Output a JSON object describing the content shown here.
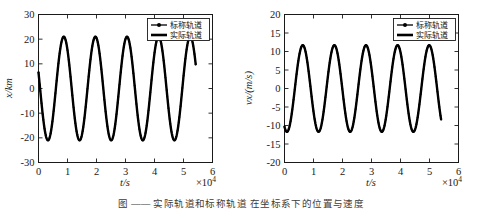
{
  "figure": {
    "caption": "图  ——  实际轨道和标称轨道    在坐标系下的位置与速度",
    "background_color": "#ffffff",
    "curve_color": "#000000",
    "axis_color": "#1a1a1a"
  },
  "legend": {
    "entries": [
      {
        "label": "标称轨道",
        "style": "line-with-circle-marker"
      },
      {
        "label": "实际轨道",
        "style": "solid-thick-line"
      }
    ]
  },
  "chart_data": [
    {
      "type": "line",
      "title": "",
      "xlabel": "t/s",
      "ylabel": "x/km",
      "x_exponent_label": "×10",
      "x_exponent_power": "4",
      "xlim": [
        0,
        6
      ],
      "ylim": [
        -30,
        30
      ],
      "xticks": [
        0,
        1,
        2,
        3,
        4,
        5,
        6
      ],
      "xtick_labels": [
        "0",
        "1",
        "2",
        "3",
        "4",
        "5",
        "6"
      ],
      "yticks": [
        -30,
        -20,
        -10,
        0,
        10,
        20,
        30
      ],
      "ytick_labels": [
        "-30",
        "-20",
        "-10",
        "0",
        "10",
        "20",
        "30"
      ],
      "grid": false,
      "legend_position": "upper-right",
      "series": [
        {
          "name": "标称轨道",
          "marker": "circle",
          "amplitude": 21.0,
          "period_x": 1.09,
          "phase_deg": 72,
          "x_start": 0,
          "x_end": 5.42,
          "x": [
            0.0,
            0.1,
            0.2,
            0.3,
            0.4,
            0.5,
            0.6,
            0.7,
            0.8,
            0.9,
            1.0,
            1.1,
            1.2,
            1.3,
            1.4,
            1.5,
            1.6,
            1.7,
            1.8,
            1.9,
            2.0,
            2.1,
            2.2,
            2.3,
            2.4,
            2.5,
            2.6,
            2.7,
            2.8,
            2.9,
            3.0,
            3.1,
            3.2,
            3.3,
            3.4,
            3.5,
            3.6,
            3.7,
            3.8,
            3.9,
            4.0,
            4.1,
            4.2,
            4.3,
            4.4,
            4.5,
            4.6,
            4.7,
            4.8,
            4.9,
            5.0,
            5.1,
            5.2,
            5.3,
            5.42
          ],
          "y": [
            20.0,
            13.0,
            2.5,
            -9.0,
            -17.5,
            -21.0,
            -19.0,
            -11.5,
            -1.0,
            10.0,
            18.0,
            20.9,
            18.5,
            11.0,
            0.5,
            -10.5,
            -18.5,
            -21.0,
            -17.8,
            -10.0,
            0.5,
            11.0,
            18.8,
            21.0,
            17.5,
            9.5,
            -1.5,
            -12.0,
            -19.0,
            -21.0,
            -17.0,
            -9.0,
            2.0,
            12.5,
            19.5,
            21.0,
            16.5,
            8.0,
            -3.0,
            -13.5,
            -20.0,
            -21.0,
            -16.0,
            -7.0,
            4.0,
            14.0,
            20.2,
            20.8,
            15.5,
            6.5,
            -5.0,
            -15.0,
            -20.5,
            -20.5,
            18.5
          ]
        },
        {
          "name": "实际轨道",
          "marker": "none",
          "amplitude": 21.0,
          "period_x": 1.09,
          "phase_deg": 72,
          "x_start": 0,
          "x_end": 5.42
        }
      ]
    },
    {
      "type": "line",
      "title": "",
      "xlabel": "t/s",
      "ylabel": "vx/(m/s)",
      "x_exponent_label": "×10",
      "x_exponent_power": "4",
      "xlim": [
        0,
        6
      ],
      "ylim": [
        -20,
        20
      ],
      "xticks": [
        0,
        1,
        2,
        3,
        4,
        5,
        6
      ],
      "xtick_labels": [
        "0",
        "1",
        "2",
        "3",
        "4",
        "5",
        "6"
      ],
      "yticks": [
        -20,
        -15,
        -10,
        -5,
        0,
        5,
        10,
        15,
        20
      ],
      "ytick_labels": [
        "-20",
        "-15",
        "-10",
        "-5",
        "0",
        "5",
        "10",
        "15",
        "20"
      ],
      "grid": false,
      "legend_position": "upper-right",
      "series": [
        {
          "name": "标称轨道",
          "marker": "circle",
          "amplitude": 11.7,
          "period_x": 1.09,
          "phase_deg": 152,
          "x_start": 0,
          "x_end": 5.4,
          "x": [
            0.0,
            0.1,
            0.2,
            0.3,
            0.4,
            0.5,
            0.6,
            0.7,
            0.8,
            0.9,
            1.0,
            1.1,
            1.2,
            1.3,
            1.4,
            1.5,
            1.6,
            1.7,
            1.8,
            1.9,
            2.0,
            2.1,
            2.2,
            2.3,
            2.4,
            2.5,
            2.6,
            2.7,
            2.8,
            2.9,
            3.0,
            3.1,
            3.2,
            3.3,
            3.4,
            3.5,
            3.6,
            3.7,
            3.8,
            3.9,
            4.0,
            4.1,
            4.2,
            4.3,
            4.4,
            4.5,
            4.6,
            4.7,
            4.8,
            4.9,
            5.0,
            5.1,
            5.2,
            5.3,
            5.4
          ],
          "y": [
            5.5,
            -1.0,
            -7.5,
            -11.3,
            -11.6,
            -8.2,
            -2.3,
            4.3,
            9.7,
            11.7,
            10.6,
            6.3,
            0.3,
            -6.0,
            -10.6,
            -11.7,
            -9.4,
            -4.2,
            2.3,
            8.2,
            11.5,
            11.4,
            7.8,
            2.2,
            -4.2,
            -9.4,
            -11.7,
            -10.3,
            -5.8,
            0.5,
            6.7,
            10.9,
            11.7,
            9.0,
            3.6,
            -3.0,
            -8.6,
            -11.6,
            -11.0,
            -7.2,
            -1.4,
            5.0,
            9.9,
            11.7,
            10.2,
            5.6,
            -0.8,
            -7.0,
            -11.0,
            -11.7,
            -8.8,
            -3.3,
            3.4,
            9.0,
            5.4
          ]
        },
        {
          "name": "实际轨道",
          "marker": "none",
          "amplitude": 11.7,
          "period_x": 1.09,
          "phase_deg": 152,
          "x_start": 0,
          "x_end": 5.4
        }
      ]
    }
  ]
}
